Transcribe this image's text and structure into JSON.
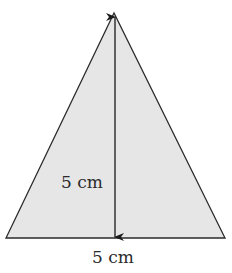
{
  "diagram": {
    "shape": "isosceles-triangle",
    "fill_color": "#e6e6e6",
    "stroke_color": "#2b2b2b",
    "height_label": "5 cm",
    "base_label": "5 cm"
  }
}
